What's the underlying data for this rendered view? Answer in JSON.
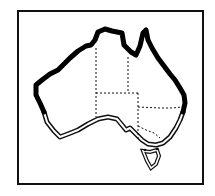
{
  "map": {
    "subject": "Australia outline map",
    "frame_color": "#111111",
    "background": "#ffffff",
    "legend_styles": {
      "thick_coastline": "northern, western and eastern coast (solid heavy black line)",
      "double_coastline": "southern coast (outlined double line)",
      "state_borders": "dashed internal borders"
    },
    "regions": [
      "Western Australia",
      "Northern Territory",
      "South Australia",
      "Queensland",
      "New South Wales",
      "Victoria",
      "Tasmania"
    ]
  }
}
